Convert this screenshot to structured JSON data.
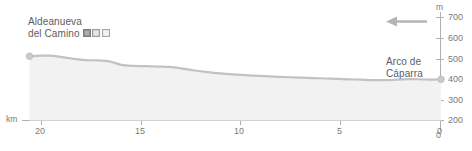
{
  "chart_data": {
    "type": "area",
    "title": "",
    "subtitle": "",
    "xlabel": "km",
    "ylabel": "m",
    "xlim": [
      21.5,
      0
    ],
    "ylim": [
      0,
      730
    ],
    "x_ticks": [
      "20",
      "15",
      "10",
      "5",
      "0"
    ],
    "x_tick_values": [
      20,
      15,
      10,
      5,
      0
    ],
    "y_ticks": [
      "700",
      "600",
      "500",
      "400",
      "300",
      "200",
      "0"
    ],
    "y_tick_values": [
      700,
      600,
      500,
      400,
      300,
      200,
      0
    ],
    "grid": false,
    "legend": "none",
    "x_axis_direction": "descending",
    "series": [
      {
        "name": "elevation",
        "x": [
          20.6,
          20.2,
          19.6,
          19.0,
          18.4,
          17.8,
          17.2,
          16.6,
          16.0,
          15.4,
          14.8,
          14.2,
          13.6,
          13.0,
          12.4,
          11.8,
          11.2,
          10.6,
          10.0,
          9.4,
          8.8,
          8.2,
          7.6,
          7.0,
          6.4,
          5.8,
          5.2,
          4.6,
          4.0,
          3.4,
          2.8,
          2.2,
          1.6,
          1.0,
          0.5,
          0.0
        ],
        "y": [
          512,
          514,
          515,
          508,
          499,
          493,
          492,
          487,
          470,
          465,
          464,
          462,
          460,
          453,
          444,
          436,
          430,
          425,
          421,
          418,
          415,
          412,
          410,
          408,
          406,
          404,
          402,
          400,
          398,
          396,
          396,
          398,
          401,
          400,
          398,
          400
        ]
      }
    ],
    "annotations": [
      {
        "name": "start-point",
        "label": "Aldeanueva del Camino",
        "x": 20.6,
        "y": 512,
        "marker": "dot"
      },
      {
        "name": "end-point",
        "label": "Arco de Cáparra",
        "x": 0.0,
        "y": 400,
        "marker": "dot"
      },
      {
        "name": "direction-arrow",
        "label": "",
        "direction": "left"
      }
    ]
  },
  "labels": {
    "start_place_line1": "Aldeanueva",
    "start_place_line2": "del Camino",
    "end_place_line1": "Arco de",
    "end_place_line2": "Cáparra",
    "x_unit": "km",
    "y_unit": "m"
  },
  "badges": [
    {
      "name": "badge-icon-1",
      "style": "b-dark"
    },
    {
      "name": "badge-icon-2",
      "style": "b-mid"
    },
    {
      "name": "badge-icon-3",
      "style": "b-light"
    }
  ],
  "colors": {
    "profile_line": "#c2c2c2",
    "profile_fill": "#f0f0f0",
    "axis": "#b0b0b0",
    "tick_text": "#7a7a7a",
    "place_text": "#5d5d5d",
    "arrow": "#b5b5b5",
    "marker": "#c9c9c9",
    "background": "#ffffff"
  }
}
